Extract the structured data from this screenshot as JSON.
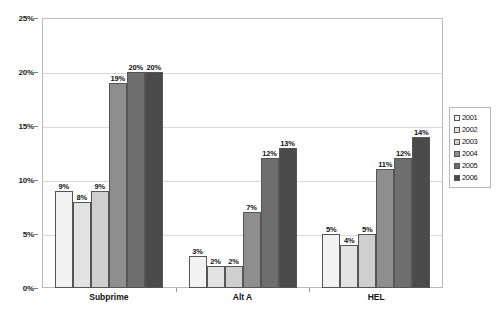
{
  "chart_data": {
    "type": "bar",
    "title": "",
    "subtitle": "",
    "xlabel": "",
    "ylabel": "",
    "categories": [
      "Subprime",
      "Alt A",
      "HEL"
    ],
    "series": [
      {
        "name": "2001",
        "color": "#f2f2f2",
        "values": [
          9,
          3,
          5
        ],
        "labels": [
          "9%",
          "3%",
          "5%"
        ]
      },
      {
        "name": "2002",
        "color": "#e3e3e3",
        "values": [
          8,
          2,
          4
        ],
        "labels": [
          "8%",
          "2%",
          "4%"
        ]
      },
      {
        "name": "2003",
        "color": "#cfcfcf",
        "values": [
          9,
          2,
          5
        ],
        "labels": [
          "9%",
          "2%",
          "5%"
        ]
      },
      {
        "name": "2004",
        "color": "#8e8e8e",
        "values": [
          19,
          7,
          11
        ],
        "labels": [
          "19%",
          "7%",
          "11%"
        ]
      },
      {
        "name": "2005",
        "color": "#6e6e6e",
        "values": [
          20,
          12,
          12
        ],
        "labels": [
          "20%",
          "12%",
          "12%"
        ]
      },
      {
        "name": "2006",
        "color": "#4a4a4a",
        "values": [
          20,
          13,
          14
        ],
        "labels": [
          "20%",
          "13%",
          "14%"
        ]
      }
    ],
    "ylim": [
      0,
      25
    ],
    "y_ticks": [
      0,
      5,
      10,
      15,
      20,
      25
    ],
    "y_tick_labels": [
      "0%",
      "5%",
      "10%",
      "15%",
      "20%",
      "25%"
    ],
    "grid": true,
    "legend_position": "right",
    "legend_entries": [
      "2001",
      "2002",
      "2003",
      "2004",
      "2005",
      "2006"
    ]
  },
  "colors": {
    "plot_border": "#b9b9b9",
    "gridline": "#d9d9d9",
    "bar_outline": "#555555",
    "text": "#111111",
    "background": "#ffffff"
  }
}
